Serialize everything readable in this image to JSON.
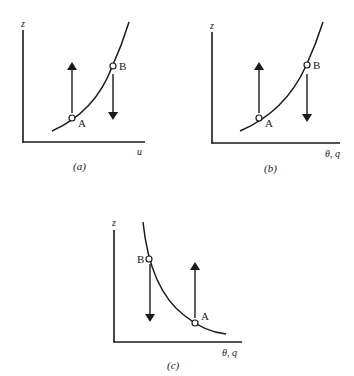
{
  "panels": [
    {
      "id": "a",
      "caption": "(a)",
      "x_axis_label": "u",
      "y_axis_label": "z",
      "curve": "increasing, concave (z increases faster with u)",
      "points": [
        {
          "label": "A",
          "position": "lower on curve",
          "arrow": "up"
        },
        {
          "label": "B",
          "position": "higher on curve",
          "arrow": "down"
        }
      ]
    },
    {
      "id": "b",
      "caption": "(b)",
      "x_axis_label": "θ, q",
      "y_axis_label": "z",
      "curve": "increasing",
      "points": [
        {
          "label": "A",
          "position": "lower on curve",
          "arrow": "up"
        },
        {
          "label": "B",
          "position": "higher on curve",
          "arrow": "down"
        }
      ]
    },
    {
      "id": "c",
      "caption": "(c)",
      "x_axis_label": "θ, q",
      "y_axis_label": "z",
      "curve": "decreasing",
      "points": [
        {
          "label": "B",
          "position": "upper-left on curve",
          "arrow": "down"
        },
        {
          "label": "A",
          "position": "lower-right on curve",
          "arrow": "up"
        }
      ]
    }
  ],
  "colors": {
    "ink": "#1a1a1a",
    "background": "#ffffff"
  }
}
